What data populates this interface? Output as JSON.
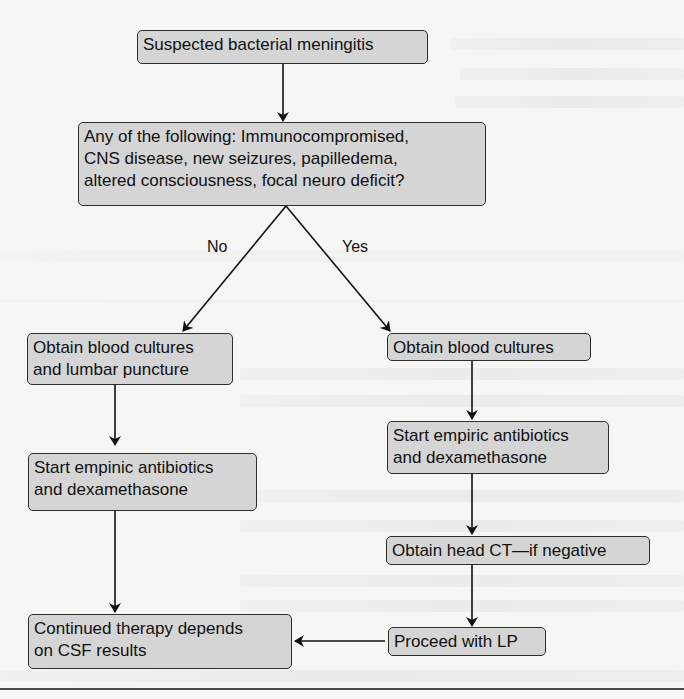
{
  "flowchart": {
    "title": "Suspected bacterial meningitis management algorithm",
    "nodes": {
      "start": {
        "lines": [
          "Suspected bacterial meningitis"
        ]
      },
      "question": {
        "lines": [
          "Any of the following: Immunocompromised,",
          "CNS disease, new seizures, papilledema,",
          "altered consciousness, focal neuro deficit?"
        ]
      },
      "no_1": {
        "lines": [
          "Obtain blood cultures",
          "and lumbar puncture"
        ]
      },
      "no_2": {
        "lines": [
          "Start empinic antibiotics",
          "and dexamethasone"
        ]
      },
      "yes_1": {
        "lines": [
          "Obtain blood cultures"
        ]
      },
      "yes_2": {
        "lines": [
          "Start empiric antibiotics",
          "and dexamethasone"
        ]
      },
      "yes_3": {
        "lines": [
          "Obtain head CT—if negative"
        ]
      },
      "yes_4": {
        "lines": [
          "Proceed with LP"
        ]
      },
      "end": {
        "lines": [
          "Continued therapy depends",
          "on CSF results"
        ]
      }
    },
    "edge_labels": {
      "no": "No",
      "yes": "Yes"
    },
    "colors": {
      "node_fill": "#d5d5d5",
      "node_border": "#2e2e2e",
      "arrow": "#111111",
      "background": "#f6f6f4"
    }
  }
}
